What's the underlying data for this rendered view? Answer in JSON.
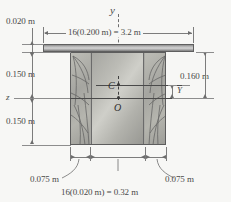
{
  "figure": {
    "type": "engineering-cross-section-diagram",
    "axes": {
      "vertical_axis_label": "y",
      "horizontal_axis_label": "z"
    },
    "points": {
      "centroid_label": "C",
      "origin_label": "O"
    },
    "dimensions": {
      "flange_thickness": "0.020 m",
      "top_width": "16(0.200 m) = 3.2 m",
      "web_upper_height": "0.150 m",
      "web_lower_height": "0.150 m",
      "right_total_height": "0.160 m",
      "centroid_offset": "Y",
      "left_web_width": "0.075 m",
      "right_web_width": "0.075 m",
      "bottom_width": "16(0.020 m) = 0.32 m"
    },
    "colors": {
      "line": "#7c7c7c",
      "text": "#4a4a4a",
      "flange_fill": "#b9b9b9",
      "web_fill": "#cfcfc9",
      "panel_fill": "#b0b0aa",
      "background": "#f7f7f5"
    }
  }
}
